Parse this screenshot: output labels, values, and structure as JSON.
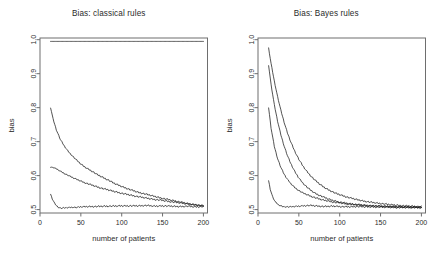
{
  "figure": {
    "background": "#ffffff",
    "line_color": "#1a1a1a",
    "axis_color": "#6e6e6e",
    "text_color": "#2b2b2b"
  },
  "panels": [
    {
      "id": "classical",
      "title": "Bias: classical rules",
      "xlabel": "number of patients",
      "ylabel": "bias"
    },
    {
      "id": "bayes",
      "title": "Bias: Bayes rules",
      "xlabel": "number of patients",
      "ylabel": "bias"
    }
  ],
  "chart_data": [
    {
      "type": "line",
      "title": "Bias: classical rules",
      "xlabel": "number of patients",
      "ylabel": "bias",
      "xlim": [
        0,
        205
      ],
      "ylim": [
        0.49,
        1.005
      ],
      "xticks": [
        0,
        50,
        100,
        150,
        200
      ],
      "yticks": [
        0.5,
        0.6,
        0.7,
        0.8,
        0.9,
        1.0
      ],
      "ytick_labels": [
        "0.5",
        "0.6",
        "0.7",
        "0.8",
        "0.9",
        "1.0"
      ],
      "xtick_labels": [
        "0",
        "50",
        "100",
        "150",
        "200"
      ],
      "grid": false,
      "legend": "none",
      "series": [
        {
          "name": "flat-rule",
          "x": [
            13,
            20,
            30,
            40,
            50,
            60,
            70,
            80,
            90,
            100,
            110,
            120,
            130,
            140,
            150,
            160,
            170,
            180,
            190,
            200
          ],
          "values": [
            0.995,
            0.995,
            0.995,
            0.995,
            0.995,
            0.995,
            0.995,
            0.995,
            0.995,
            0.995,
            0.995,
            0.995,
            0.995,
            0.995,
            0.995,
            0.995,
            0.995,
            0.995,
            0.995,
            0.995
          ]
        },
        {
          "name": "upper-decay",
          "x": [
            13,
            16,
            20,
            25,
            30,
            35,
            40,
            45,
            50,
            55,
            60,
            65,
            70,
            75,
            80,
            85,
            90,
            95,
            100,
            110,
            120,
            130,
            140,
            150,
            160,
            170,
            180,
            190,
            200
          ],
          "values": [
            0.8,
            0.767,
            0.735,
            0.706,
            0.686,
            0.67,
            0.657,
            0.645,
            0.634,
            0.625,
            0.618,
            0.611,
            0.603,
            0.597,
            0.591,
            0.585,
            0.578,
            0.573,
            0.568,
            0.559,
            0.551,
            0.545,
            0.539,
            0.533,
            0.528,
            0.523,
            0.518,
            0.514,
            0.511
          ]
        },
        {
          "name": "middle-decay",
          "x": [
            13,
            16,
            20,
            25,
            30,
            35,
            40,
            45,
            50,
            55,
            60,
            65,
            70,
            75,
            80,
            85,
            90,
            95,
            100,
            110,
            120,
            130,
            140,
            150,
            160,
            170,
            180,
            190,
            200
          ],
          "values": [
            0.625,
            0.624,
            0.62,
            0.613,
            0.606,
            0.6,
            0.594,
            0.589,
            0.584,
            0.579,
            0.575,
            0.571,
            0.567,
            0.563,
            0.56,
            0.557,
            0.554,
            0.551,
            0.548,
            0.543,
            0.538,
            0.534,
            0.53,
            0.527,
            0.523,
            0.52,
            0.517,
            0.514,
            0.511
          ]
        },
        {
          "name": "lower-flat",
          "x": [
            13,
            15,
            18,
            20,
            23,
            26,
            30,
            35,
            40,
            45,
            50,
            60,
            70,
            80,
            90,
            100,
            110,
            120,
            130,
            140,
            150,
            160,
            170,
            180,
            190,
            200
          ],
          "values": [
            0.545,
            0.532,
            0.518,
            0.512,
            0.506,
            0.504,
            0.505,
            0.506,
            0.507,
            0.506,
            0.508,
            0.509,
            0.509,
            0.51,
            0.51,
            0.511,
            0.511,
            0.511,
            0.512,
            0.51,
            0.511,
            0.51,
            0.509,
            0.51,
            0.508,
            0.509
          ]
        }
      ]
    },
    {
      "type": "line",
      "title": "Bias: Bayes rules",
      "xlabel": "number of patients",
      "ylabel": "bias",
      "xlim": [
        0,
        205
      ],
      "ylim": [
        0.49,
        1.005
      ],
      "xticks": [
        0,
        50,
        100,
        150,
        200
      ],
      "yticks": [
        0.5,
        0.6,
        0.7,
        0.8,
        0.9,
        1.0
      ],
      "ytick_labels": [
        "0.5",
        "0.6",
        "0.7",
        "0.8",
        "0.9",
        "1.0"
      ],
      "xtick_labels": [
        "0",
        "50",
        "100",
        "150",
        "200"
      ],
      "grid": false,
      "legend": "none",
      "series": [
        {
          "name": "bayes-curve-1",
          "x": [
            13,
            16,
            20,
            24,
            28,
            32,
            36,
            40,
            45,
            50,
            55,
            60,
            65,
            70,
            75,
            80,
            85,
            90,
            95,
            100,
            110,
            120,
            130,
            140,
            150,
            160,
            170,
            180,
            190,
            200
          ],
          "values": [
            0.975,
            0.93,
            0.878,
            0.832,
            0.792,
            0.757,
            0.726,
            0.7,
            0.672,
            0.648,
            0.628,
            0.612,
            0.598,
            0.586,
            0.576,
            0.567,
            0.56,
            0.554,
            0.548,
            0.544,
            0.536,
            0.53,
            0.525,
            0.521,
            0.518,
            0.515,
            0.513,
            0.511,
            0.51,
            0.508
          ]
        },
        {
          "name": "bayes-curve-2",
          "x": [
            13,
            16,
            20,
            24,
            28,
            32,
            36,
            40,
            45,
            50,
            55,
            60,
            65,
            70,
            75,
            80,
            85,
            90,
            95,
            100,
            110,
            120,
            130,
            140,
            150,
            160,
            170,
            180,
            190,
            200
          ],
          "values": [
            0.925,
            0.868,
            0.808,
            0.76,
            0.72,
            0.687,
            0.659,
            0.636,
            0.612,
            0.593,
            0.578,
            0.566,
            0.556,
            0.548,
            0.542,
            0.537,
            0.532,
            0.528,
            0.525,
            0.522,
            0.518,
            0.515,
            0.513,
            0.511,
            0.51,
            0.509,
            0.508,
            0.508,
            0.507,
            0.507
          ]
        },
        {
          "name": "bayes-curve-3",
          "x": [
            13,
            16,
            20,
            24,
            28,
            32,
            36,
            40,
            45,
            50,
            55,
            60,
            65,
            70,
            75,
            80,
            85,
            90,
            95,
            100,
            110,
            120,
            130,
            140,
            150,
            160,
            170,
            180,
            190,
            200
          ],
          "values": [
            0.8,
            0.74,
            0.686,
            0.65,
            0.624,
            0.604,
            0.589,
            0.577,
            0.565,
            0.556,
            0.549,
            0.544,
            0.539,
            0.535,
            0.531,
            0.528,
            0.526,
            0.523,
            0.521,
            0.52,
            0.516,
            0.514,
            0.512,
            0.511,
            0.51,
            0.509,
            0.508,
            0.508,
            0.507,
            0.507
          ]
        },
        {
          "name": "bayes-curve-4",
          "x": [
            13,
            15,
            18,
            21,
            25,
            30,
            35,
            40,
            45,
            50,
            55,
            60,
            65,
            70,
            75,
            80,
            85,
            90,
            95,
            100,
            110,
            120,
            130,
            140,
            150,
            160,
            170,
            180,
            190,
            200
          ],
          "values": [
            0.585,
            0.56,
            0.537,
            0.523,
            0.514,
            0.509,
            0.508,
            0.508,
            0.509,
            0.51,
            0.511,
            0.512,
            0.512,
            0.511,
            0.51,
            0.509,
            0.509,
            0.51,
            0.51,
            0.509,
            0.508,
            0.509,
            0.508,
            0.508,
            0.507,
            0.507,
            0.506,
            0.506,
            0.506,
            0.505
          ]
        }
      ]
    }
  ]
}
